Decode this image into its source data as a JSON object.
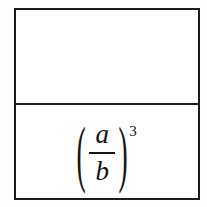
{
  "document": {
    "type": "math-table",
    "background_color": "#fefefe",
    "border_color": "#1c1c1c"
  },
  "table": {
    "rows": [
      {
        "name": "top-cell",
        "content": "",
        "empty": true
      },
      {
        "name": "bottom-cell",
        "empty": false,
        "expression": {
          "notation": "(a/b)^3",
          "open_paren": "(",
          "close_paren": ")",
          "numerator": "a",
          "fraction_bar": "",
          "denominator": "b",
          "exponent": "3"
        }
      }
    ]
  }
}
